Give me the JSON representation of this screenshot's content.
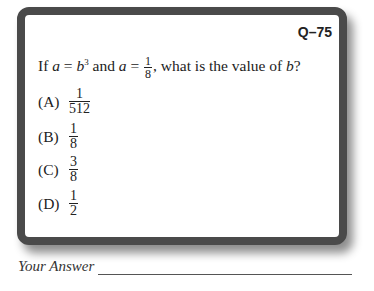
{
  "card": {
    "question_id": "Q–75",
    "question": {
      "prefix": "If ",
      "var_a": "a",
      "eq1": " = ",
      "var_b": "b",
      "exp": "3",
      "mid": " and ",
      "var_a2": "a",
      "eq2": " = ",
      "frac_num": "1",
      "frac_den": "8",
      "suffix": ", what is the value of ",
      "var_b2": "b",
      "end": "?"
    },
    "choices": [
      {
        "label": "(A)",
        "num": "1",
        "den": "512"
      },
      {
        "label": "(B)",
        "num": "1",
        "den": "8"
      },
      {
        "label": "(C)",
        "num": "3",
        "den": "8"
      },
      {
        "label": "(D)",
        "num": "1",
        "den": "2"
      }
    ]
  },
  "answer": {
    "label": "Your Answer"
  }
}
